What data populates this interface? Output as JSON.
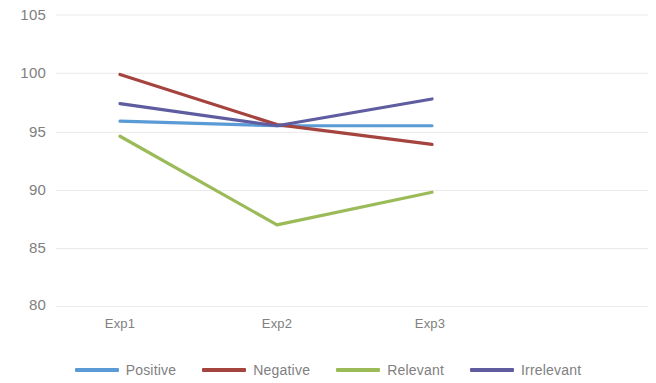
{
  "chart_data": {
    "type": "line",
    "title": "",
    "xlabel": "",
    "ylabel": "",
    "categories": [
      "Exp1",
      "Exp2",
      "Exp3"
    ],
    "ylim": [
      80,
      105
    ],
    "yticks": [
      80,
      85,
      90,
      95,
      100,
      105
    ],
    "grid": true,
    "legend_position": "bottom",
    "series": [
      {
        "name": "Positive",
        "color": "#5b9bd5",
        "values": [
          95.9,
          95.5,
          95.5
        ]
      },
      {
        "name": "Negative",
        "color": "#a5433f",
        "values": [
          99.9,
          95.6,
          93.9
        ]
      },
      {
        "name": "Relevant",
        "color": "#9bbb59",
        "values": [
          94.6,
          87.0,
          89.8
        ]
      },
      {
        "name": "Irrelevant",
        "color": "#5f5ca0",
        "values": [
          97.4,
          95.5,
          97.8
        ]
      }
    ]
  },
  "axes": {
    "y_tick_labels": [
      "105",
      "100",
      "95",
      "90",
      "85",
      "80"
    ],
    "x_tick_labels": [
      "Exp1",
      "Exp2",
      "Exp3"
    ]
  },
  "legend": {
    "items": [
      {
        "label": "Positive"
      },
      {
        "label": "Negative"
      },
      {
        "label": "Relevant"
      },
      {
        "label": "Irrelevant"
      }
    ]
  },
  "colors": {
    "positive": "#5b9bd5",
    "negative": "#a5433f",
    "relevant": "#9bbb59",
    "irrelevant": "#5f5ca0",
    "gridline": "#e8e8e8",
    "text": "#808080",
    "background": "#ffffff"
  }
}
